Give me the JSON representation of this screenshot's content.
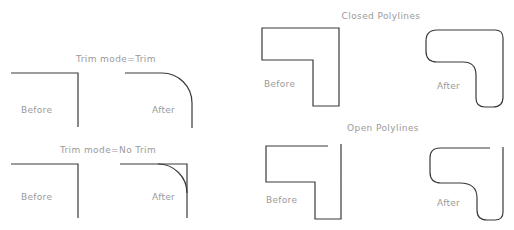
{
  "left_panel": {
    "trim": {
      "title": "Trim mode=Trim",
      "before_label": "Before",
      "after_label": "After"
    },
    "no_trim": {
      "title": "Trim mode=No Trim",
      "before_label": "Before",
      "after_label": "After"
    }
  },
  "right_panel": {
    "closed": {
      "title": "Closed Polylines",
      "before_label": "Before",
      "after_label": "After"
    },
    "open": {
      "title": "Open Polylines",
      "before_label": "Before",
      "after_label": "After"
    }
  },
  "colors": {
    "line": "#3a3a3a",
    "text": "#9a9a9a",
    "background": "#ffffff"
  }
}
